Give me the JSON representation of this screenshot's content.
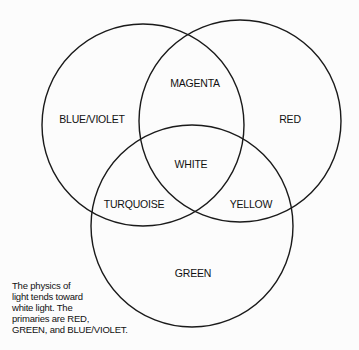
{
  "diagram": {
    "type": "venn",
    "circles": [
      {
        "name": "BLUE/VIOLET",
        "cx": 143,
        "cy": 125,
        "r": 101
      },
      {
        "name": "RED",
        "cx": 240,
        "cy": 121,
        "r": 101
      },
      {
        "name": "GREEN",
        "cx": 192,
        "cy": 226,
        "r": 101
      }
    ],
    "stroke_color": "#1a1a1a",
    "labels": {
      "blue_violet": "BLUE/VIOLET",
      "red": "RED",
      "green": "GREEN",
      "magenta": "MAGENTA",
      "white": "WHITE",
      "turquoise": "TURQUOISE",
      "yellow": "YELLOW"
    },
    "caption_lines": [
      "The physics of",
      "light tends toward",
      "white light. The",
      "primaries are RED,",
      "GREEN, and BLUE/VIOLET."
    ]
  }
}
